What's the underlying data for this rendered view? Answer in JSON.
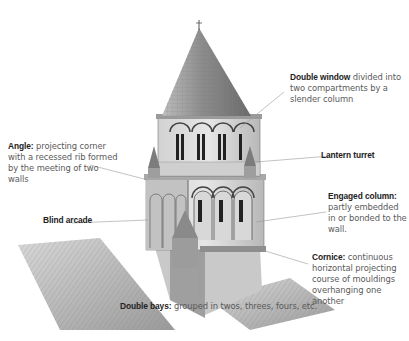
{
  "diagram": {
    "labels": [
      {
        "id": "double-window",
        "term": "Double window",
        "desc": " divided into two compartments by a slender column",
        "lines": [
          "Double window divided",
          "into two compartments",
          "by a slender column"
        ]
      },
      {
        "id": "angle",
        "term": "Angle:",
        "desc": " projecting corner with a recessed rib formed by the meeting of two walls",
        "lines": [
          "Angle: projecting corner with",
          "a recessed rib formed by the",
          "meeting of two walls"
        ]
      },
      {
        "id": "lantern-turret",
        "term": "Lantern turret",
        "desc": ""
      },
      {
        "id": "engaged-column",
        "term": "Engaged column:",
        "desc": " partly embedded in or bonded to the wall.",
        "lines": [
          "Engaged column:",
          "partly embedded",
          "in or bonded to",
          "the wall."
        ]
      },
      {
        "id": "blind-arcade",
        "term": "Blind arcade",
        "desc": ""
      },
      {
        "id": "cornice",
        "term": "Cornice:",
        "desc": " continuous horizontal projecting course of mouldings overhanging one another",
        "lines": [
          "Cornice: continuous",
          "horizontal projecting",
          "course of mouldings",
          "overhanging one",
          "another"
        ]
      },
      {
        "id": "double-bays",
        "term": "Double bays:",
        "desc": " grouped in twos, threes, fours, etc."
      }
    ],
    "colors": {
      "leader_line": "#9a9a9a",
      "ink": "#333333",
      "text": "#5a5a5a",
      "term": "#222222"
    }
  }
}
